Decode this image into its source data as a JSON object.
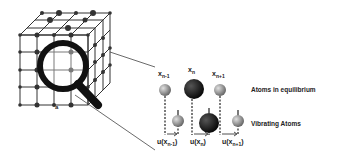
{
  "diagram": {
    "lattice": {
      "label": "a"
    },
    "equilibrium_labels": [
      "x_{n-1}",
      "x_n",
      "x_{n+1}"
    ],
    "displacement_labels": [
      "u(x_{n-1})",
      "u(x_n)",
      "u(x_{n+1})"
    ],
    "row_labels": {
      "equilibrium": "Atoms in equilibrium",
      "vibrating": "Vibrating Atoms"
    },
    "colors": {
      "small_atom": "#9a9a9a",
      "large_atom": "#1a1a1a",
      "lines": "#333333"
    }
  }
}
